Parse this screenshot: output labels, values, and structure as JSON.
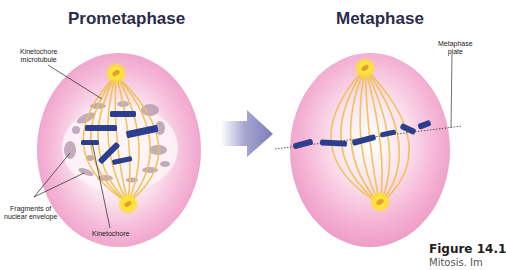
{
  "figure": {
    "panels": [
      {
        "title": "Prometaphase",
        "labels": {
          "kinetochore_microtubule": [
            "Kinetochore",
            "microtubule"
          ],
          "fragments": [
            "Fragments of",
            "nuclear envelope"
          ],
          "kinetochore": "Kinetochore"
        }
      },
      {
        "title": "Metaphase",
        "labels": {
          "metaphase_plate": [
            "Metaphase",
            "plate"
          ]
        }
      }
    ],
    "arrow": "right-arrow",
    "caption": {
      "title": "Figure 14.1",
      "text": "Mitosis. Im"
    },
    "colors": {
      "cell_outer": "#f2a9cf",
      "cell_inner": "#fbe6f1",
      "spindle": "#f0c04a",
      "centrosome": "#ffe23a",
      "chromosome": "#2c3f8f",
      "envelope_fragment": "#b59aae",
      "arrow": "#8c8cc0",
      "title_text": "#2b2b4a"
    }
  }
}
